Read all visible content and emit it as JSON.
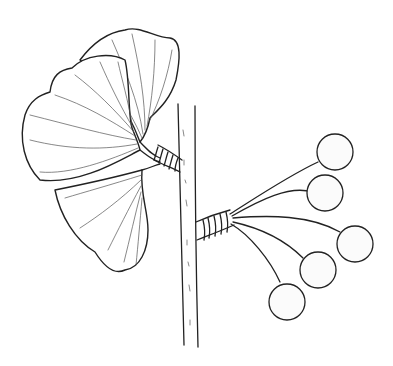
{
  "illustration": {
    "subject": "Ginkgo biloba branch with leaves and seeds",
    "style": "black ink botanical line drawing on white",
    "colors": {
      "ink": "#222222",
      "background": "#ffffff",
      "seed_stipple": "#999999"
    },
    "parts": {
      "stem": "vertical woody stem",
      "leaf_spur": "short shoot bearing fan-shaped leaves",
      "leaves": [
        "upper leaf",
        "middle leaf",
        "lower leaf"
      ],
      "seed_spur": "short shoot bearing long-stalked seeds",
      "seeds": [
        "seed 1",
        "seed 2",
        "seed 3",
        "seed 4",
        "seed 5"
      ]
    }
  }
}
